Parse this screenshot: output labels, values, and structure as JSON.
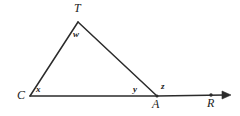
{
  "figure": {
    "kind": "geometry-diagram",
    "canvas": {
      "width": 240,
      "height": 116
    },
    "background_color": "#ffffff",
    "stroke_color": "#2b2b2b",
    "label_color": "#1c1c1c",
    "stroke_width": 1.4,
    "vertices": {
      "T": {
        "x": 78,
        "y": 22,
        "label": "T"
      },
      "C": {
        "x": 30,
        "y": 96,
        "label": "C"
      },
      "A": {
        "x": 157,
        "y": 96,
        "label": "A"
      },
      "R": {
        "x": 211,
        "y": 95,
        "label": "R"
      }
    },
    "segments": [
      {
        "name": "side-CT",
        "from": "C",
        "to": "T"
      },
      {
        "name": "side-TA",
        "from": "T",
        "to": "A"
      },
      {
        "name": "base-CA",
        "from": "C",
        "to": "A"
      },
      {
        "name": "ray-AR",
        "from": "A",
        "to": "R",
        "arrow": true
      }
    ],
    "angle_labels": {
      "apex": "w",
      "left": "x",
      "interior_right": "y",
      "exterior_right": "z"
    },
    "vertex_labels": {
      "apex": "T",
      "left": "C",
      "right": "A",
      "ray_point": "R"
    }
  }
}
